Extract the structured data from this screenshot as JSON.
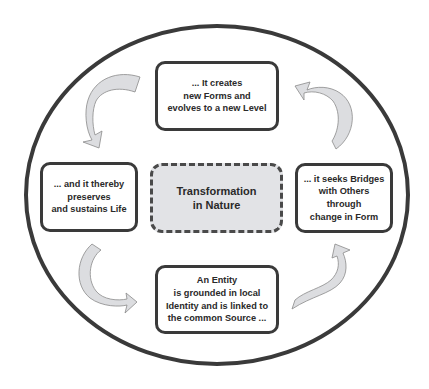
{
  "diagram": {
    "title": "Transformation in Nature",
    "center": {
      "lines": [
        "Transformation",
        "in Nature"
      ],
      "style": "dashed",
      "fill": "#e2e3e6"
    },
    "nodes": [
      {
        "position": "bottom",
        "lines": [
          "An Entity",
          "is grounded in local",
          "Identity and is linked to",
          "the common Source ..."
        ]
      },
      {
        "position": "right",
        "lines": [
          "... it seeks Bridges",
          "with Others",
          "through",
          "change in Form"
        ]
      },
      {
        "position": "top",
        "lines": [
          "... It creates",
          "new Forms and",
          "evolves to a new Level"
        ]
      },
      {
        "position": "left",
        "lines": [
          "... and it thereby",
          "preserves",
          "and sustains Life"
        ]
      }
    ],
    "arrows": [
      {
        "name": "bottom-to-right",
        "direction": "counter-clockwise cycle"
      },
      {
        "name": "right-to-top",
        "direction": "counter-clockwise cycle"
      },
      {
        "name": "top-to-left",
        "direction": "counter-clockwise cycle"
      },
      {
        "name": "left-to-bottom",
        "direction": "counter-clockwise cycle"
      }
    ],
    "colors": {
      "outline": "#3a3a3a",
      "arrow_fill": "#dcdde0",
      "arrow_stroke": "#8a8a8a",
      "center_fill": "#e2e3e6"
    }
  }
}
